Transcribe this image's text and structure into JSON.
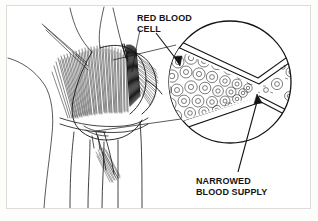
{
  "figure": {
    "kind": "medical-line-illustration",
    "background_color": "#ffffff",
    "border_color": "#dddcd8",
    "ink_color": "#111111"
  },
  "labels": {
    "red_blood_cell": "RED BLOOD\nCELL",
    "narrowed_blood_supply": "NARROWED\nBLOOD SUPPLY"
  },
  "icons": {
    "arrow_to_cells": "arrow-down-right-icon",
    "arrow_to_narrowing": "arrow-up-icon",
    "leader_line_upper": "leader-line-icon",
    "leader_line_lower": "leader-line-icon"
  },
  "inset": {
    "shape": "circle",
    "center_x": 230,
    "center_y": 82,
    "radius": 62,
    "content": "blood vessel with stenosis and red blood cells",
    "cells_upstream_count": 34,
    "cells_downstream_count": 5
  },
  "anatomy": {
    "region": "hip-buttock",
    "technique": "pen-and-ink hatching"
  }
}
